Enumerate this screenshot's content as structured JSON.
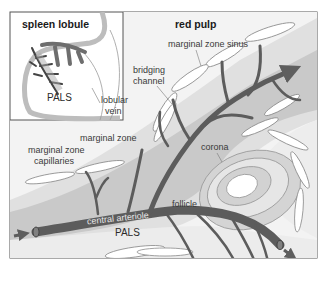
{
  "figure": {
    "inset": {
      "title": "spleen lobule",
      "labels": {
        "pals": "PALS",
        "lobular_vein": [
          "lobular",
          "vein"
        ]
      }
    },
    "main": {
      "region_title": "red pulp",
      "labels": {
        "marginal_zone_sinus": "marginal zone sinus",
        "bridging_channel": [
          "bridging",
          "channel"
        ],
        "marginal_zone": "marginal zone",
        "marginal_zone_capillaries": [
          "marginal zone",
          "capillaries"
        ],
        "corona": "corona",
        "follicle": "follicle",
        "central_arteriole": "central arteriole",
        "pals": "PALS"
      }
    },
    "colors": {
      "red_pulp": "#f2f2f2",
      "marginal_zone": "#dedede",
      "pals_band": "#c6c6c6",
      "vessel": "#5e5e5e",
      "frame": "#555555"
    }
  }
}
